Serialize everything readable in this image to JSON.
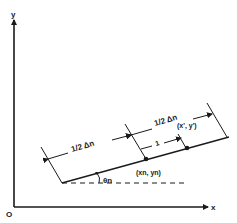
{
  "diagram": {
    "axes": {
      "x_label": "x",
      "y_label": "y",
      "origin_label": "O"
    },
    "dimensions": {
      "left_half": "1/2 Δn",
      "right_half": "1/2 Δn",
      "offset": "1"
    },
    "points": {
      "center": "(xn, yn)",
      "target": "(x', y')"
    },
    "angle_label": "θn",
    "colors": {
      "ink": "#1a1a1a",
      "background": "#ffffff"
    }
  }
}
